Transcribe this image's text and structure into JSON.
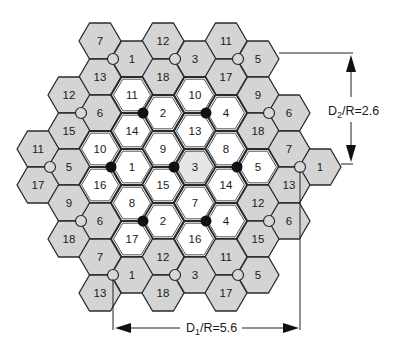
{
  "colors": {
    "outer_cell_fill": "#d4d4d4",
    "inner_cell_fill": "#ffffff",
    "stroke": "#2a2a2a",
    "interferer_dot": "#111111",
    "site_circle_fill": "#d8d8d8"
  },
  "dimensions": {
    "d2": {
      "label_main": "D",
      "label_sub": "2",
      "label_rest": "/R=2.6"
    },
    "d1": {
      "label_main": "D",
      "label_sub": "1",
      "label_rest": "/R=5.6"
    }
  },
  "cells": [
    {
      "x": 100,
      "y": 41,
      "label": "7",
      "type": "outer"
    },
    {
      "x": 163,
      "y": 41,
      "label": "12",
      "type": "outer"
    },
    {
      "x": 226,
      "y": 41,
      "label": "11",
      "type": "outer"
    },
    {
      "x": 132,
      "y": 59,
      "label": "1",
      "type": "outer"
    },
    {
      "x": 195,
      "y": 59,
      "label": "3",
      "type": "outer"
    },
    {
      "x": 258,
      "y": 59,
      "label": "5",
      "type": "outer"
    },
    {
      "x": 100,
      "y": 77,
      "label": "13",
      "type": "outer"
    },
    {
      "x": 163,
      "y": 77,
      "label": "18",
      "type": "outer"
    },
    {
      "x": 226,
      "y": 77,
      "label": "17",
      "type": "outer"
    },
    {
      "x": 69,
      "y": 95,
      "label": "12",
      "type": "outer"
    },
    {
      "x": 132,
      "y": 95,
      "label": "11",
      "type": "inner"
    },
    {
      "x": 195,
      "y": 95,
      "label": "10",
      "type": "inner"
    },
    {
      "x": 258,
      "y": 95,
      "label": "9",
      "type": "outer"
    },
    {
      "x": 100,
      "y": 113,
      "label": "6",
      "type": "outer"
    },
    {
      "x": 163,
      "y": 113,
      "label": "2",
      "type": "inner"
    },
    {
      "x": 226,
      "y": 113,
      "label": "4",
      "type": "inner"
    },
    {
      "x": 289,
      "y": 113,
      "label": "6",
      "type": "outer"
    },
    {
      "x": 69,
      "y": 131,
      "label": "15",
      "type": "outer"
    },
    {
      "x": 132,
      "y": 131,
      "label": "14",
      "type": "inner"
    },
    {
      "x": 195,
      "y": 131,
      "label": "13",
      "type": "inner"
    },
    {
      "x": 258,
      "y": 131,
      "label": "18",
      "type": "outer"
    },
    {
      "x": 38,
      "y": 149,
      "label": "11",
      "type": "outer"
    },
    {
      "x": 100,
      "y": 149,
      "label": "10",
      "type": "inner"
    },
    {
      "x": 163,
      "y": 149,
      "label": "9",
      "type": "inner"
    },
    {
      "x": 226,
      "y": 149,
      "label": "8",
      "type": "inner"
    },
    {
      "x": 289,
      "y": 149,
      "label": "7",
      "type": "outer"
    },
    {
      "x": 69,
      "y": 167,
      "label": "5",
      "type": "outer"
    },
    {
      "x": 132,
      "y": 167,
      "label": "1",
      "type": "inner"
    },
    {
      "x": 195,
      "y": 167,
      "label": "3",
      "type": "inner_shaded"
    },
    {
      "x": 258,
      "y": 167,
      "label": "5",
      "type": "inner"
    },
    {
      "x": 320,
      "y": 167,
      "label": "1",
      "type": "outer"
    },
    {
      "x": 38,
      "y": 185,
      "label": "17",
      "type": "outer"
    },
    {
      "x": 100,
      "y": 185,
      "label": "16",
      "type": "inner"
    },
    {
      "x": 163,
      "y": 185,
      "label": "15",
      "type": "inner"
    },
    {
      "x": 226,
      "y": 185,
      "label": "14",
      "type": "inner"
    },
    {
      "x": 289,
      "y": 185,
      "label": "13",
      "type": "outer"
    },
    {
      "x": 69,
      "y": 203,
      "label": "9",
      "type": "outer"
    },
    {
      "x": 132,
      "y": 203,
      "label": "8",
      "type": "inner"
    },
    {
      "x": 195,
      "y": 203,
      "label": "7",
      "type": "inner"
    },
    {
      "x": 258,
      "y": 203,
      "label": "12",
      "type": "outer"
    },
    {
      "x": 100,
      "y": 221,
      "label": "6",
      "type": "outer"
    },
    {
      "x": 163,
      "y": 221,
      "label": "2",
      "type": "inner"
    },
    {
      "x": 226,
      "y": 221,
      "label": "4",
      "type": "inner"
    },
    {
      "x": 289,
      "y": 221,
      "label": "6",
      "type": "outer"
    },
    {
      "x": 69,
      "y": 239,
      "label": "18",
      "type": "outer"
    },
    {
      "x": 132,
      "y": 239,
      "label": "17",
      "type": "inner"
    },
    {
      "x": 195,
      "y": 239,
      "label": "16",
      "type": "inner"
    },
    {
      "x": 258,
      "y": 239,
      "label": "15",
      "type": "outer"
    },
    {
      "x": 100,
      "y": 257,
      "label": "7",
      "type": "outer"
    },
    {
      "x": 163,
      "y": 257,
      "label": "12",
      "type": "outer"
    },
    {
      "x": 226,
      "y": 257,
      "label": "11",
      "type": "outer"
    },
    {
      "x": 132,
      "y": 275,
      "label": "1",
      "type": "outer"
    },
    {
      "x": 195,
      "y": 275,
      "label": "3",
      "type": "outer"
    },
    {
      "x": 258,
      "y": 275,
      "label": "5",
      "type": "outer"
    },
    {
      "x": 100,
      "y": 293,
      "label": "13",
      "type": "outer"
    },
    {
      "x": 163,
      "y": 293,
      "label": "18",
      "type": "outer"
    },
    {
      "x": 226,
      "y": 293,
      "label": "17",
      "type": "outer"
    }
  ],
  "black_dots": [
    {
      "x": 143,
      "y": 113
    },
    {
      "x": 206,
      "y": 113
    },
    {
      "x": 111,
      "y": 167
    },
    {
      "x": 174,
      "y": 167
    },
    {
      "x": 237,
      "y": 167
    },
    {
      "x": 143,
      "y": 221
    },
    {
      "x": 206,
      "y": 221
    }
  ],
  "site_circles": [
    {
      "x": 113,
      "y": 59
    },
    {
      "x": 175,
      "y": 59
    },
    {
      "x": 238,
      "y": 59
    },
    {
      "x": 81,
      "y": 113
    },
    {
      "x": 269,
      "y": 113
    },
    {
      "x": 50,
      "y": 167
    },
    {
      "x": 300,
      "y": 167
    },
    {
      "x": 81,
      "y": 221
    },
    {
      "x": 269,
      "y": 221
    },
    {
      "x": 113,
      "y": 275
    },
    {
      "x": 175,
      "y": 275
    },
    {
      "x": 238,
      "y": 275
    }
  ]
}
